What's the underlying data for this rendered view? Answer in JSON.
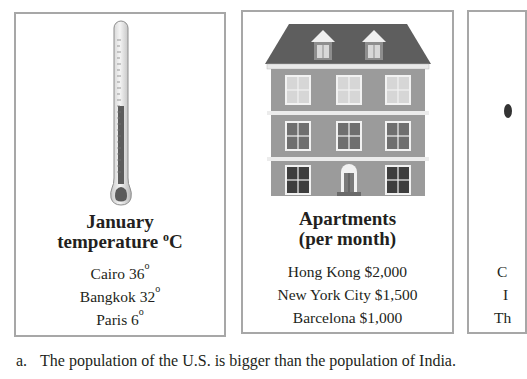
{
  "cards": [
    {
      "icon": "thermometer-icon",
      "title_line1": "January",
      "title_line2": "temperature",
      "title_unit_degree": "o",
      "title_unit": "C",
      "items": [
        {
          "city": "Cairo",
          "value": "36",
          "degree": "o"
        },
        {
          "city": "Bangkok",
          "value": "32",
          "degree": "o"
        },
        {
          "city": "Paris",
          "value": "6",
          "degree": "o"
        }
      ]
    },
    {
      "icon": "apartment-building-icon",
      "title_line1": "Apartments",
      "title_line2": "(per month)",
      "items": [
        {
          "text": "Hong Kong $2,000"
        },
        {
          "text": "New York City $1,500"
        },
        {
          "text": "Barcelona $1,000"
        }
      ]
    },
    {
      "icon": "partial-image-icon",
      "items": [
        {
          "text": "C"
        },
        {
          "text": "I"
        },
        {
          "text": "Th"
        }
      ]
    }
  ],
  "statement": {
    "label": "a.",
    "text": "The population of the U.S. is bigger than the population of India."
  }
}
